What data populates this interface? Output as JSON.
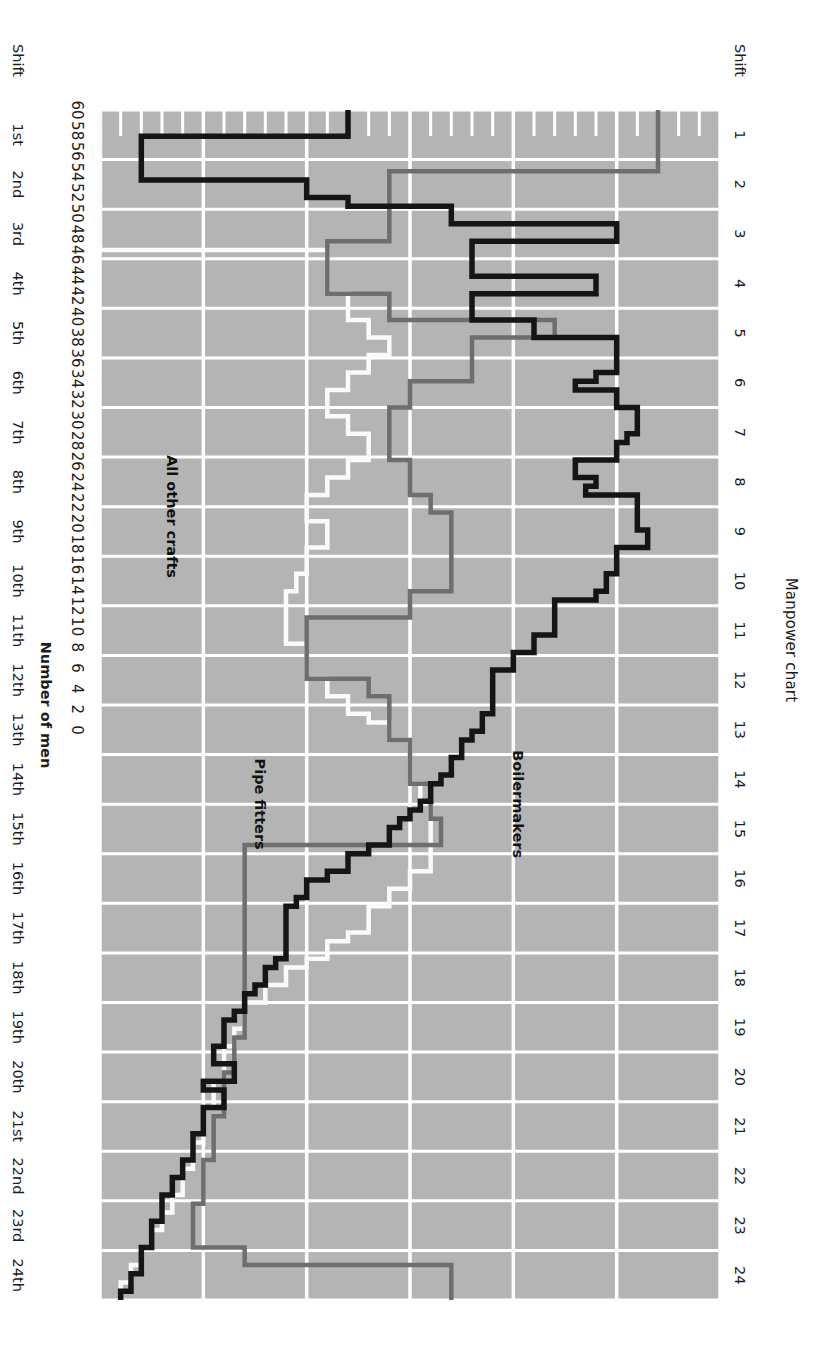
{
  "chart_data": {
    "type": "line",
    "title": "Manpower chart",
    "xlabel": "",
    "ylabel": "Number of men",
    "orientation": "rotated-90",
    "grid": true,
    "legend_position": "inline-labels",
    "ylim": [
      0,
      60
    ],
    "ytick_step": 2,
    "yticks": [
      0,
      2,
      4,
      6,
      8,
      10,
      12,
      14,
      16,
      18,
      20,
      22,
      24,
      26,
      28,
      30,
      32,
      34,
      36,
      38,
      40,
      42,
      44,
      46,
      48,
      50,
      52,
      54,
      56,
      58,
      60
    ],
    "xlim": [
      0,
      24
    ],
    "x_axis_rows": [
      {
        "name": "shift-number-row",
        "label": "Shift",
        "ticks": [
          "1",
          "2",
          "3",
          "4",
          "5",
          "6",
          "7",
          "8",
          "9",
          "10",
          "11",
          "12",
          "13",
          "14",
          "15",
          "16",
          "17",
          "18",
          "19",
          "20",
          "21",
          "22",
          "23",
          "24"
        ]
      },
      {
        "name": "shift-ordinal-row",
        "label": "Shift",
        "ticks": [
          "1st",
          "2nd",
          "3rd",
          "4th",
          "5th",
          "6th",
          "7th",
          "8th",
          "9th",
          "10th",
          "11th",
          "12th",
          "13th",
          "14th",
          "15th",
          "16th",
          "17th",
          "18th",
          "19th",
          "20th",
          "21st",
          "22nd",
          "23rd",
          "24th"
        ]
      },
      {
        "name": "day-row",
        "label": "Day",
        "ticks": [
          "1",
          "2",
          "3",
          "4",
          "5",
          "6",
          "7",
          "8",
          "9",
          "10",
          "11",
          "12"
        ]
      }
    ],
    "series": [
      {
        "name": "Boilermakers",
        "color": "#151515",
        "label_x": 14.0,
        "label_y": 40.5,
        "values": [
          24,
          24,
          24,
          4,
          4,
          4,
          4,
          4,
          20,
          20,
          24,
          34,
          34,
          50,
          50,
          36,
          36,
          36,
          36,
          48,
          48,
          36,
          36,
          36,
          42,
          42,
          50,
          50,
          50,
          50,
          48,
          46,
          50,
          50,
          52,
          52,
          52,
          51,
          50,
          50,
          46,
          46,
          48,
          47,
          52,
          52,
          52,
          52,
          53,
          53,
          50,
          50,
          50,
          49,
          49,
          48,
          44,
          44,
          44,
          44,
          42,
          42,
          40,
          40,
          38,
          38,
          38,
          38,
          38,
          37,
          37,
          36,
          35,
          35,
          34,
          34,
          33,
          32,
          32,
          31,
          30,
          29,
          28,
          28,
          26,
          24,
          24,
          22,
          20,
          20,
          19,
          18,
          18,
          18,
          18,
          18,
          18,
          17,
          16,
          16,
          15,
          14,
          14,
          13,
          12,
          12,
          12,
          11,
          11,
          13,
          13,
          10,
          12,
          12,
          10,
          10,
          10,
          9,
          9,
          9,
          8,
          8,
          7,
          7,
          6,
          6,
          6,
          5,
          5,
          5,
          4,
          4,
          4,
          3,
          3,
          2
        ]
      },
      {
        "name": "Pipe fitters",
        "color": "#6e6e6e",
        "label_x": 14.0,
        "label_y": 15.5,
        "values": [
          54,
          54,
          54,
          54,
          54,
          54,
          54,
          28,
          28,
          28,
          28,
          28,
          28,
          28,
          28,
          22,
          22,
          22,
          22,
          22,
          22,
          28,
          28,
          28,
          44,
          44,
          36,
          36,
          36,
          36,
          36,
          30,
          30,
          30,
          28,
          28,
          28,
          28,
          28,
          28,
          30,
          30,
          30,
          30,
          32,
          32,
          34,
          34,
          34,
          34,
          34,
          34,
          34,
          34,
          34,
          30,
          30,
          30,
          20,
          20,
          20,
          20,
          20,
          20,
          20,
          26,
          26,
          28,
          28,
          28,
          28,
          28,
          30,
          30,
          30,
          30,
          30,
          32,
          32,
          32,
          32,
          33,
          33,
          33,
          14,
          14,
          14,
          14,
          14,
          14,
          14,
          14,
          14,
          14,
          14,
          14,
          14,
          14,
          14,
          14,
          14,
          14,
          14,
          14,
          14,
          14,
          13,
          13,
          13,
          13,
          12,
          12,
          12,
          12,
          12,
          11,
          11,
          11,
          11,
          11,
          10,
          10,
          10,
          10,
          10,
          9,
          9,
          9,
          9,
          9,
          14,
          14,
          34,
          34,
          34,
          34
        ]
      },
      {
        "name": "All other crafts",
        "color": "#fafafa",
        "label_x": 8.2,
        "label_y": 7.0,
        "values": [
          0,
          0,
          0,
          0,
          0,
          0,
          0,
          0,
          0,
          0,
          0,
          0,
          0,
          0,
          0,
          0,
          22,
          22,
          22,
          22,
          22,
          24,
          24,
          24,
          26,
          26,
          28,
          28,
          26,
          26,
          24,
          24,
          22,
          22,
          22,
          24,
          24,
          26,
          26,
          26,
          24,
          24,
          22,
          22,
          20,
          20,
          20,
          22,
          22,
          22,
          20,
          20,
          20,
          19,
          19,
          18,
          18,
          18,
          18,
          18,
          18,
          20,
          20,
          20,
          20,
          22,
          22,
          24,
          24,
          26,
          28,
          28,
          30,
          30,
          30,
          30,
          30,
          31,
          31,
          32,
          32,
          32,
          32,
          32,
          32,
          32,
          32,
          30,
          30,
          28,
          28,
          26,
          26,
          26,
          24,
          22,
          22,
          20,
          18,
          18,
          16,
          16,
          14,
          14,
          14,
          13,
          13,
          12,
          12,
          12,
          12,
          11,
          11,
          11,
          10,
          10,
          10,
          10,
          9,
          9,
          9,
          8,
          8,
          8,
          7,
          7,
          6,
          6,
          5,
          5,
          4,
          4,
          3,
          3,
          2,
          2
        ]
      }
    ]
  }
}
